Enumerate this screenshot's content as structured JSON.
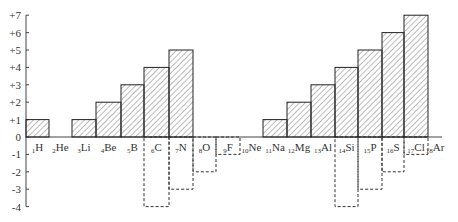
{
  "chart_data": {
    "type": "bar",
    "title": "",
    "xlabel": "",
    "ylabel": "",
    "ylim": [
      -4,
      7
    ],
    "grid": false,
    "legend": null,
    "y_ticks": [
      "+7",
      "+6",
      "+5",
      "+4",
      "+3",
      "+2",
      "+1",
      "0",
      "-1",
      "-2",
      "-3",
      "-4"
    ],
    "categories": [
      {
        "number": "1",
        "symbol": "H"
      },
      {
        "number": "2",
        "symbol": "He"
      },
      {
        "number": "3",
        "symbol": "Li"
      },
      {
        "number": "4",
        "symbol": "Be"
      },
      {
        "number": "5",
        "symbol": "B"
      },
      {
        "number": "6",
        "symbol": "C"
      },
      {
        "number": "7",
        "symbol": "N"
      },
      {
        "number": "8",
        "symbol": "O"
      },
      {
        "number": "9",
        "symbol": "F"
      },
      {
        "number": "10",
        "symbol": "Ne"
      },
      {
        "number": "11",
        "symbol": "Na"
      },
      {
        "number": "12",
        "symbol": "Mg"
      },
      {
        "number": "13",
        "symbol": "Al"
      },
      {
        "number": "14",
        "symbol": "Si"
      },
      {
        "number": "15",
        "symbol": "P"
      },
      {
        "number": "16",
        "symbol": "S"
      },
      {
        "number": "17",
        "symbol": "Cl"
      },
      {
        "number": "18",
        "symbol": "Ar"
      }
    ],
    "series": [
      {
        "name": "Highest positive valence",
        "style": "solid-hatched",
        "values": [
          1,
          0,
          1,
          2,
          3,
          4,
          5,
          0,
          0,
          0,
          1,
          2,
          3,
          4,
          5,
          6,
          7,
          0
        ]
      },
      {
        "name": "Lowest negative valence",
        "style": "dashed-outline",
        "values": [
          0,
          0,
          0,
          0,
          0,
          -4,
          -3,
          -2,
          -1,
          0,
          0,
          0,
          0,
          -4,
          -3,
          -2,
          -1,
          0
        ]
      }
    ]
  }
}
